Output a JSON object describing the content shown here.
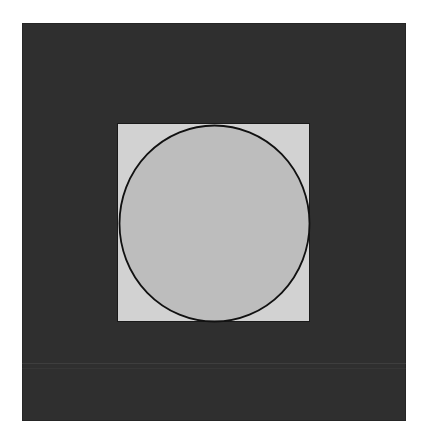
{
  "figure": {
    "colors": {
      "background": "#ffffff",
      "outer_square": "#2f2f2f",
      "inner_square": "#d2d2d2",
      "circle_fill": "#bdbdbd",
      "circle_stroke": "#111111"
    },
    "shapes": [
      "outer-square",
      "inner-square",
      "inscribed-circle"
    ]
  }
}
